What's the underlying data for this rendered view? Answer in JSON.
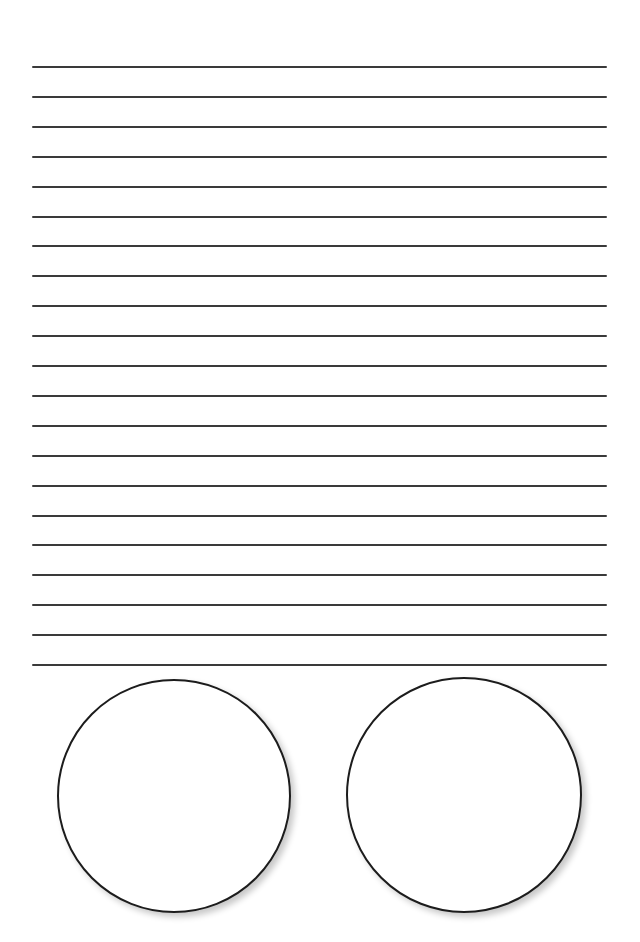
{
  "page": {
    "background": "#ffffff",
    "line_color": "#3a3a3a",
    "circle_stroke": "#1c1c1c"
  },
  "ruled_lines": {
    "count": 21,
    "first_y": 66,
    "spacing": 29.9,
    "left": 32,
    "width": 575
  },
  "circles": [
    {
      "label": "",
      "cx": 174,
      "cy": 796,
      "r": 117
    },
    {
      "label": "",
      "cx": 464,
      "cy": 795,
      "r": 118
    }
  ]
}
